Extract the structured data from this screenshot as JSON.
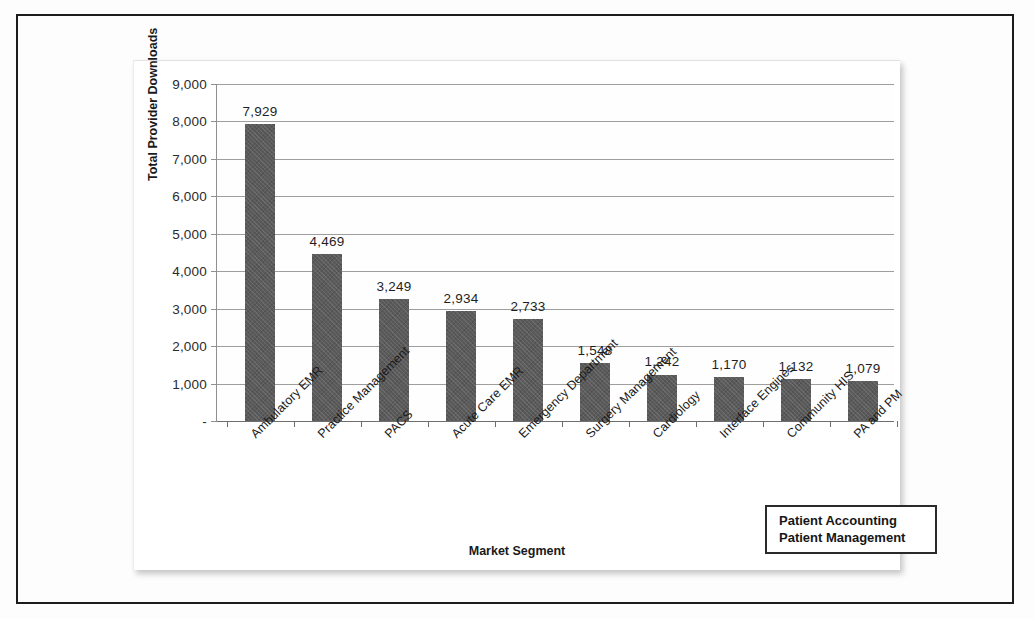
{
  "chart_data": {
    "type": "bar",
    "title": "",
    "xlabel": "Market Segment",
    "ylabel": "Total Provider Downloads",
    "categories": [
      "Ambulatory EMR",
      "Practice Management",
      "PACS",
      "Acute Care EMR",
      "Emergency Department",
      "Surgery Management",
      "Cardiology",
      "Interface Engines",
      "Community HIS",
      "PA and PM"
    ],
    "values": [
      7929,
      4469,
      3249,
      2934,
      2733,
      1548,
      1242,
      1170,
      1132,
      1079
    ],
    "value_labels": [
      "7,929",
      "4,469",
      "3,249",
      "2,934",
      "2,733",
      "1,548",
      "1,242",
      "1,170",
      "1,132",
      "1,079"
    ],
    "ylim": [
      0,
      9000
    ],
    "ytick_values": [
      9000,
      8000,
      7000,
      6000,
      5000,
      4000,
      3000,
      2000,
      1000,
      0
    ],
    "ytick_labels": [
      "9,000",
      "8,000",
      "7,000",
      "6,000",
      "5,000",
      "4,000",
      "3,000",
      "2,000",
      "1,000",
      "-"
    ],
    "grid": true,
    "legend_position": "none",
    "bar_color": "#5b5b5b",
    "gridline_color": "#9e9e9e"
  },
  "annotation": {
    "line1": "Patient Accounting",
    "line2": "Patient Management"
  }
}
